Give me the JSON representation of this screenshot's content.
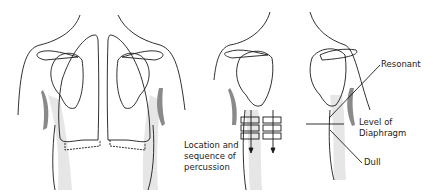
{
  "figure": {
    "colors": {
      "outline": "#1a1a1a",
      "shadow_light": "#e6e6e6",
      "shadow_dark": "#8a8a8a",
      "text": "#222222"
    }
  },
  "labels": {
    "location": "Location and sequence of percussion",
    "resonant": "Resonant",
    "level": "Level of Diaphragm",
    "dull": "Dull"
  }
}
